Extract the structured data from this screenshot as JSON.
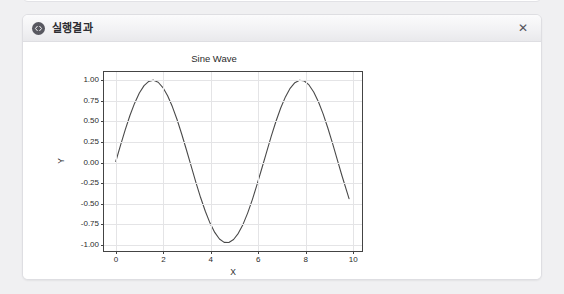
{
  "window": {
    "title": "실행결과",
    "icon": "code-icon",
    "close_label": "✕"
  },
  "chart_data": {
    "type": "line",
    "title": "Sine Wave",
    "xlabel": "X",
    "ylabel": "Y",
    "xlim": [
      -0.5,
      10.45
    ],
    "ylim": [
      -1.1,
      1.1
    ],
    "grid": true,
    "legend": null,
    "line_color": "#4a4a4a",
    "xticks": [
      "0",
      "2",
      "4",
      "6",
      "8",
      "10"
    ],
    "xtick_values": [
      0,
      2,
      4,
      6,
      8,
      10
    ],
    "yticks": [
      "1.00",
      "0.75",
      "0.50",
      "0.25",
      "0.00",
      "-0.25",
      "-0.50",
      "-0.75",
      "-1.00"
    ],
    "ytick_values": [
      1.0,
      0.75,
      0.5,
      0.25,
      0.0,
      -0.25,
      -0.5,
      -0.75,
      -1.0
    ],
    "series": [
      {
        "name": "sin(x)",
        "x": [
          0.0,
          0.2,
          0.4,
          0.6,
          0.8,
          1.0,
          1.2,
          1.4,
          1.6,
          1.8,
          2.0,
          2.2,
          2.4,
          2.6,
          2.8,
          3.0,
          3.2,
          3.4,
          3.6,
          3.8,
          4.0,
          4.2,
          4.4,
          4.6,
          4.8,
          5.0,
          5.2,
          5.4,
          5.6,
          5.8,
          6.0,
          6.2,
          6.4,
          6.6,
          6.8,
          7.0,
          7.2,
          7.4,
          7.6,
          7.8,
          8.0,
          8.2,
          8.4,
          8.6,
          8.8,
          9.0,
          9.2,
          9.4,
          9.6,
          9.9
        ],
        "y": [
          0.0,
          0.199,
          0.389,
          0.565,
          0.717,
          0.841,
          0.932,
          0.985,
          1.0,
          0.974,
          0.909,
          0.808,
          0.675,
          0.516,
          0.335,
          0.141,
          -0.058,
          -0.256,
          -0.443,
          -0.612,
          -0.757,
          -0.872,
          -0.952,
          -0.994,
          -0.996,
          -0.959,
          -0.883,
          -0.773,
          -0.631,
          -0.465,
          -0.279,
          -0.083,
          0.116,
          0.312,
          0.495,
          0.657,
          0.794,
          0.899,
          0.969,
          0.999,
          0.989,
          0.941,
          0.855,
          0.734,
          0.585,
          0.412,
          0.223,
          0.024,
          -0.175,
          -0.457
        ]
      }
    ]
  }
}
